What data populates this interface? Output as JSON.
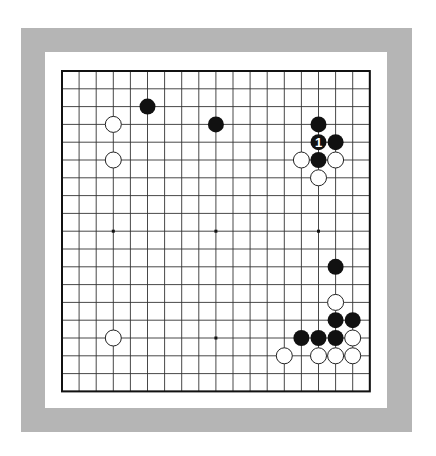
{
  "board": {
    "size": 19,
    "origin_x": 62,
    "origin_y": 71,
    "spacing_x": 17.1,
    "spacing_y": 17.8,
    "colors": {
      "frame": "#b5b5b5",
      "background": "#ffffff",
      "line": "#333333",
      "border": "#111111",
      "black_stone": "#111111",
      "white_stone": "#ffffff"
    },
    "star_points": [
      [
        3,
        9
      ],
      [
        9,
        9
      ],
      [
        15,
        9
      ],
      [
        9,
        15
      ]
    ],
    "stones": [
      {
        "color": "black",
        "col": 5,
        "row": 2
      },
      {
        "color": "white",
        "col": 3,
        "row": 3
      },
      {
        "color": "black",
        "col": 9,
        "row": 3
      },
      {
        "color": "white",
        "col": 3,
        "row": 5
      },
      {
        "color": "black",
        "col": 15,
        "row": 3
      },
      {
        "color": "black",
        "col": 15,
        "row": 4,
        "label": "1"
      },
      {
        "color": "black",
        "col": 16,
        "row": 4
      },
      {
        "color": "white",
        "col": 14,
        "row": 5
      },
      {
        "color": "black",
        "col": 15,
        "row": 5
      },
      {
        "color": "white",
        "col": 16,
        "row": 5
      },
      {
        "color": "white",
        "col": 15,
        "row": 6
      },
      {
        "color": "black",
        "col": 16,
        "row": 11
      },
      {
        "color": "white",
        "col": 16,
        "row": 13
      },
      {
        "color": "black",
        "col": 16,
        "row": 14
      },
      {
        "color": "black",
        "col": 17,
        "row": 14
      },
      {
        "color": "black",
        "col": 14,
        "row": 15
      },
      {
        "color": "black",
        "col": 15,
        "row": 15
      },
      {
        "color": "black",
        "col": 16,
        "row": 15
      },
      {
        "color": "white",
        "col": 17,
        "row": 15
      },
      {
        "color": "white",
        "col": 3,
        "row": 15
      },
      {
        "color": "white",
        "col": 13,
        "row": 16
      },
      {
        "color": "white",
        "col": 15,
        "row": 16
      },
      {
        "color": "white",
        "col": 16,
        "row": 16
      },
      {
        "color": "white",
        "col": 17,
        "row": 16
      }
    ]
  }
}
